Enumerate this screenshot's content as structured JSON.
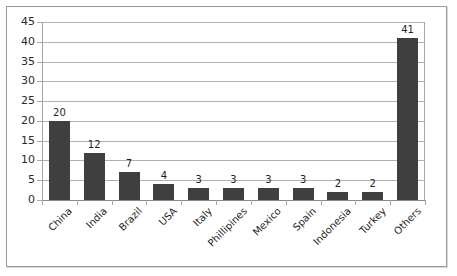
{
  "chart_data": {
    "type": "bar",
    "title": "",
    "xlabel": "",
    "ylabel": "",
    "categories": [
      "China",
      "India",
      "Brazil",
      "USA",
      "Italy",
      "Phillipines",
      "Mexico",
      "Spain",
      "Indonesia",
      "Turkey",
      "Others"
    ],
    "values": [
      20,
      12,
      7,
      4,
      3,
      3,
      3,
      3,
      2,
      2,
      41
    ],
    "ylim": [
      0,
      45
    ],
    "ytick_labels": [
      "45",
      "40",
      "35",
      "30",
      "25",
      "20",
      "15",
      "10",
      "5",
      "0"
    ],
    "ytick_values": [
      45,
      40,
      35,
      30,
      25,
      20,
      15,
      10,
      5,
      0
    ],
    "ytick_step": 5,
    "grid": true,
    "legend": false,
    "data_labels": true,
    "bar_color": "#3f3f3f",
    "gridline_color": "#b0b0b0",
    "axis_color": "#a6a6a6",
    "background_color": "#ffffff",
    "border_color": "#9a9a9a",
    "label_rotation_degrees": -45
  }
}
